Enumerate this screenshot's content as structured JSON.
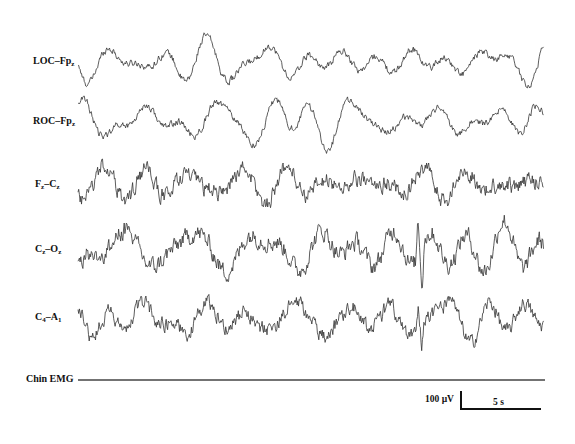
{
  "chart_data": {
    "type": "line",
    "title": "",
    "subtitle": "",
    "xlabel": "",
    "ylabel": "",
    "grid": false,
    "legend": "none",
    "channels": [
      {
        "name": "LOC–Fpz",
        "main": "LOC–Fp",
        "sub": "z",
        "baseline_y": 62,
        "amplitude": 20,
        "character": "slow high-amplitude waves"
      },
      {
        "name": "ROC–Fpz",
        "main": "ROC–Fp",
        "sub": "z",
        "baseline_y": 121,
        "amplitude": 20,
        "character": "slow high-amplitude waves"
      },
      {
        "name": "Fz–Cz",
        "main": "F",
        "sub": "z",
        "main2": "–C",
        "sub2": "z",
        "baseline_y": 184,
        "amplitude": 20,
        "character": "mixed slow waves with faster activity"
      },
      {
        "name": "Cz–Oz",
        "main": "C",
        "sub": "z",
        "main2": "–O",
        "sub2": "z",
        "baseline_y": 249,
        "amplitude": 22,
        "character": "mixed frequency with sharp transient"
      },
      {
        "name": "C4–A1",
        "main": "C",
        "sub": "4",
        "main2": "–A",
        "sub2": "1",
        "baseline_y": 319,
        "amplitude": 18,
        "character": "mixed frequency with sharp transient"
      },
      {
        "name": "Chin EMG",
        "main": "Chin EMG",
        "baseline_y": 380,
        "amplitude": 0,
        "character": "flat"
      }
    ],
    "trace_x_range": [
      78,
      544
    ],
    "scale_bar": {
      "vertical_label": "100 µV",
      "horizontal_label": "5 s"
    }
  },
  "labels": {
    "ch1_main": "LOC–Fp",
    "ch1_sub": "z",
    "ch2_main": "ROC–Fp",
    "ch2_sub": "z",
    "ch3_a": "F",
    "ch3_a_sub": "z",
    "ch3_b": "–C",
    "ch3_b_sub": "z",
    "ch4_a": "C",
    "ch4_a_sub": "z",
    "ch4_b": "–O",
    "ch4_b_sub": "z",
    "ch5_a": "C",
    "ch5_a_sub": "4",
    "ch5_b": "–A",
    "ch5_b_sub": "1",
    "ch6": "Chin EMG",
    "scale_voltage": "100 µV",
    "scale_time": "5 s"
  },
  "colors": {
    "trace": "#333333",
    "axis": "#111111"
  }
}
